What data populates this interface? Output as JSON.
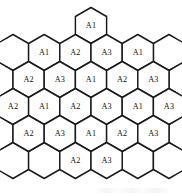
{
  "figure": {
    "name": "hexagonal-cellular-cluster",
    "type": "diagram",
    "title": "",
    "background_color": "#ffffff",
    "cell_outline_color": "#1a1a1a",
    "label_color": "#111111",
    "sector_line_color": "#b3b3b3",
    "label_values": [
      "A1",
      "A2",
      "A3"
    ],
    "cell_count": 23,
    "row_count": 6,
    "caption": ""
  },
  "geometry": {
    "hex_width": 31.2,
    "hex_height": 36.0,
    "row_step": 27.0,
    "col_step": 31.2,
    "origin_x": 91.0,
    "origin_y": 25.5,
    "orientation": "pointy-top"
  },
  "rows": [
    {
      "index": 0,
      "name": "hex-row-1",
      "cells": [
        {
          "label": "A1",
          "col": 0.0,
          "row": 0
        }
      ]
    },
    {
      "index": 1,
      "name": "hex-row-2",
      "cells": [
        {
          "label": "A1",
          "col": -1.5,
          "row": 1
        },
        {
          "label": "A2",
          "col": -0.5,
          "row": 1
        },
        {
          "label": "A3",
          "col": 0.5,
          "row": 1
        },
        {
          "label": "A1",
          "col": 1.5,
          "row": 1
        }
      ]
    },
    {
      "index": 2,
      "name": "hex-row-3",
      "cells": [
        {
          "label": "A2",
          "col": -2.0,
          "row": 2
        },
        {
          "label": "A3",
          "col": -1.0,
          "row": 2
        },
        {
          "label": "A1",
          "col": 0.0,
          "row": 2
        },
        {
          "label": "A2",
          "col": 1.0,
          "row": 2
        },
        {
          "label": "A3",
          "col": 2.0,
          "row": 2
        }
      ]
    },
    {
      "index": 3,
      "name": "hex-row-4",
      "cells": [
        {
          "label": "A2",
          "col": -2.5,
          "row": 3
        },
        {
          "label": "A1",
          "col": -1.5,
          "row": 3
        },
        {
          "label": "A2",
          "col": -0.5,
          "row": 3
        },
        {
          "label": "A3",
          "col": 0.5,
          "row": 3
        },
        {
          "label": "A1",
          "col": 1.5,
          "row": 3
        },
        {
          "label": "A3",
          "col": 2.5,
          "row": 3
        }
      ]
    },
    {
      "index": 4,
      "name": "hex-row-5",
      "cells": [
        {
          "label": "A2",
          "col": -2.0,
          "row": 4
        },
        {
          "label": "A3",
          "col": -1.0,
          "row": 4
        },
        {
          "label": "A1",
          "col": 0.0,
          "row": 4
        },
        {
          "label": "A2",
          "col": 1.0,
          "row": 4
        },
        {
          "label": "A3",
          "col": 2.0,
          "row": 4
        }
      ]
    },
    {
      "index": 5,
      "name": "hex-row-6",
      "cells": [
        {
          "label": "A2",
          "col": -0.5,
          "row": 5
        },
        {
          "label": "A3",
          "col": 0.5,
          "row": 5
        }
      ]
    }
  ],
  "hidden_rim_cells": [
    {
      "col": -2.5,
      "row": 1
    },
    {
      "col": 2.5,
      "row": 1
    },
    {
      "col": -3.0,
      "row": 2
    },
    {
      "col": 3.0,
      "row": 2
    },
    {
      "col": -3.5,
      "row": 3
    },
    {
      "col": 3.5,
      "row": 3
    },
    {
      "col": -3.0,
      "row": 4
    },
    {
      "col": 3.0,
      "row": 4
    },
    {
      "col": -2.5,
      "row": 5
    },
    {
      "col": -1.5,
      "row": 5
    },
    {
      "col": 1.5,
      "row": 5
    },
    {
      "col": 2.5,
      "row": 5
    }
  ],
  "sector_lines": {
    "name": "sector-fan",
    "apex": {
      "x": 91.0,
      "y": 61.5
    },
    "rays": [
      {
        "x": 47.0,
        "y": 112.0
      },
      {
        "x": 62.0,
        "y": 104.0
      },
      {
        "x": 91.0,
        "y": 166.0
      },
      {
        "x": 120.0,
        "y": 104.0
      },
      {
        "x": 136.0,
        "y": 112.0
      }
    ]
  }
}
